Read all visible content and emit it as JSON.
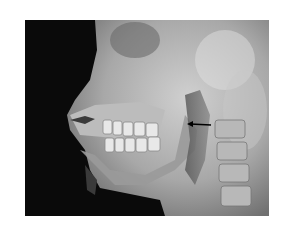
{
  "image": {
    "description": "Lateral radiograph of the skull/face showing jaw, teeth and cervical spine with an arrow pointing at the pharyngeal region",
    "annotation": {
      "type": "arrow",
      "direction": "left",
      "color": "#000000"
    },
    "colors": {
      "background": "#ffffff",
      "film_dark": "#0a0a0a",
      "bone_light": "#d8d8d8"
    }
  }
}
